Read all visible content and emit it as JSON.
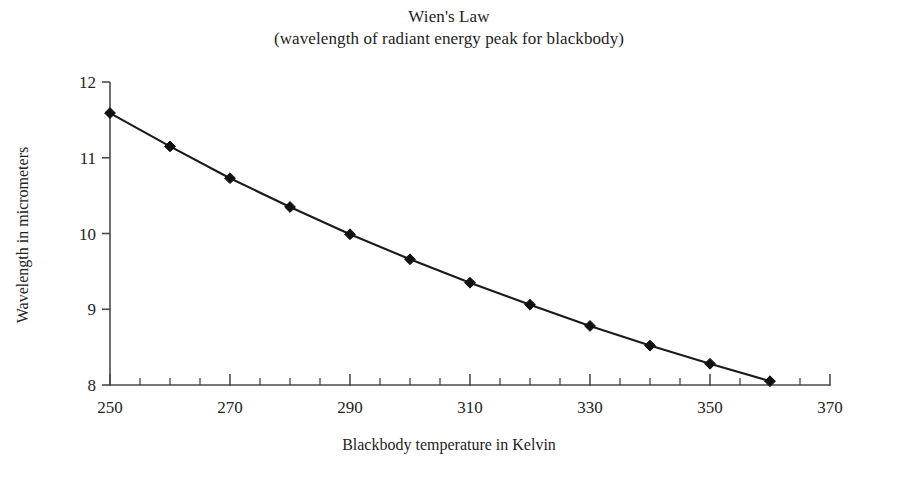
{
  "figure": {
    "title": "Wien's Law",
    "subtitle": "(wavelength of radiant energy peak for blackbody)"
  },
  "chart_data": {
    "type": "line",
    "title": "Wien's Law",
    "subtitle": "(wavelength of radiant energy peak for blackbody)",
    "xlabel": "Blackbody temperature in Kelvin",
    "ylabel": "Wavelength in micrometers",
    "xlim": [
      250,
      370
    ],
    "ylim": [
      8,
      12
    ],
    "xticks": [
      250,
      270,
      290,
      310,
      330,
      350,
      370
    ],
    "xtick_labels": [
      "250",
      "270",
      "290",
      "310",
      "330",
      "350",
      "370"
    ],
    "x_minor_tick_step": 5,
    "yticks": [
      8,
      9,
      10,
      11,
      12
    ],
    "ytick_labels": [
      "8",
      "9",
      "10",
      "11",
      "12"
    ],
    "grid": false,
    "legend": false,
    "marker": "diamond",
    "line_color": "#1a1a1a",
    "marker_color": "#111111",
    "x": [
      250,
      260,
      270,
      280,
      290,
      300,
      310,
      320,
      330,
      340,
      350,
      360
    ],
    "y": [
      11.59,
      11.15,
      10.73,
      10.35,
      9.99,
      9.66,
      9.35,
      9.06,
      8.78,
      8.52,
      8.28,
      8.05
    ],
    "series": [
      {
        "name": "Peak wavelength",
        "values": [
          11.59,
          11.15,
          10.73,
          10.35,
          9.99,
          9.66,
          9.35,
          9.06,
          8.78,
          8.52,
          8.28,
          8.05
        ]
      }
    ]
  }
}
